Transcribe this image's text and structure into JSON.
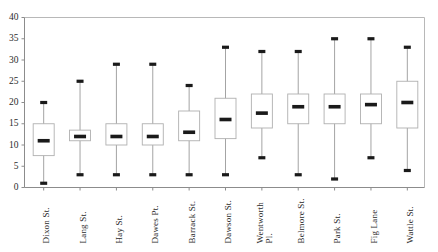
{
  "chart_data": {
    "type": "box",
    "title": "",
    "xlabel": "",
    "ylabel": "",
    "ylim": [
      0,
      40
    ],
    "y_ticks": [
      0,
      5,
      10,
      15,
      20,
      25,
      30,
      35,
      40
    ],
    "grid": false,
    "legend": "none",
    "categories": [
      "Dixon St.",
      "Lang St.",
      "Hay St.",
      "Dawes Pt.",
      "Barrack St.",
      "Dawson St.",
      "Wentworth Pl.",
      "Belmore St.",
      "Park St.",
      "Fig Lane",
      "Wattle St."
    ],
    "category_lines": [
      [
        "Dixon St."
      ],
      [
        "Lang St."
      ],
      [
        "Hay St."
      ],
      [
        "Dawes Pt."
      ],
      [
        "Barrack St."
      ],
      [
        "Dawson St."
      ],
      [
        "Wentworth",
        "Pl."
      ],
      [
        "Belmore St."
      ],
      [
        "Park St."
      ],
      [
        "Fig Lane"
      ],
      [
        "Wattle St."
      ]
    ],
    "boxes": [
      {
        "label": "Dixon St.",
        "min": 1,
        "q1": 7.5,
        "median": 11,
        "q3": 15,
        "max": 20
      },
      {
        "label": "Lang St.",
        "min": 3,
        "q1": 11,
        "median": 12,
        "q3": 13.5,
        "max": 25
      },
      {
        "label": "Hay St.",
        "min": 3,
        "q1": 10,
        "median": 12,
        "q3": 15,
        "max": 29
      },
      {
        "label": "Dawes Pt.",
        "min": 3,
        "q1": 10,
        "median": 12,
        "q3": 15,
        "max": 29
      },
      {
        "label": "Barrack St.",
        "min": 3,
        "q1": 11,
        "median": 13,
        "q3": 18,
        "max": 24
      },
      {
        "label": "Dawson St.",
        "min": 3,
        "q1": 11.5,
        "median": 16,
        "q3": 21,
        "max": 33
      },
      {
        "label": "Wentworth Pl.",
        "min": 7,
        "q1": 14,
        "median": 17.5,
        "q3": 22,
        "max": 32
      },
      {
        "label": "Belmore St.",
        "min": 3,
        "q1": 15,
        "median": 19,
        "q3": 22,
        "max": 32
      },
      {
        "label": "Park St.",
        "min": 2,
        "q1": 15,
        "median": 19,
        "q3": 22,
        "max": 35
      },
      {
        "label": "Fig Lane",
        "min": 7,
        "q1": 15,
        "median": 19.5,
        "q3": 22,
        "max": 35
      },
      {
        "label": "Wattle St.",
        "min": 4,
        "q1": 14,
        "median": 20,
        "q3": 25,
        "max": 33
      }
    ],
    "colors": {
      "box_fill": "#ffffff",
      "box_stroke": "#b0b0b0",
      "whisker": "#9a9a9a",
      "marker": "#1a1a1a",
      "axis": "#8c8c8c",
      "frame": "#b8b8b8",
      "text": "#2b2b2b",
      "background": "#ffffff"
    }
  }
}
